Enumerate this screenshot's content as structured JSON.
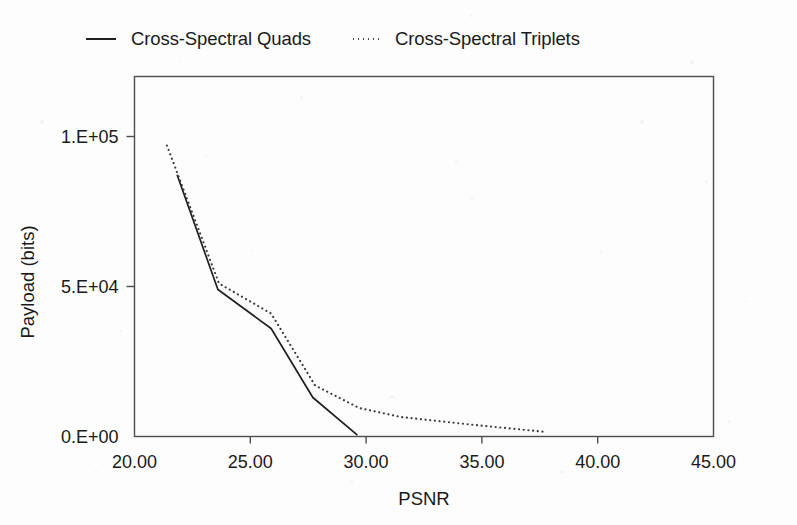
{
  "legend": {
    "entries": [
      {
        "label": "Cross-Spectral Quads",
        "style": "solid"
      },
      {
        "label": "Cross-Spectral Triplets",
        "style": "dotted"
      }
    ]
  },
  "axes": {
    "x_title": "PSNR",
    "y_title": "Payload (bits)",
    "x_ticks": [
      "20.00",
      "25.00",
      "30.00",
      "35.00",
      "40.00",
      "45.00"
    ],
    "y_ticks": [
      "0.E+00",
      "5.E+04",
      "1.E+05"
    ]
  },
  "chart_data": {
    "type": "line",
    "title": "",
    "xlabel": "PSNR",
    "ylabel": "Payload (bits)",
    "xlim": [
      20,
      45
    ],
    "ylim": [
      0,
      120000
    ],
    "xticks": [
      20,
      25,
      30,
      35,
      40,
      45
    ],
    "xticklabels": [
      "20.00",
      "25.00",
      "30.00",
      "35.00",
      "40.00",
      "45.00"
    ],
    "yticks": [
      0,
      50000,
      100000
    ],
    "yticklabels": [
      "0.E+00",
      "5.E+04",
      "1.E+05"
    ],
    "grid": false,
    "legend_position": "top",
    "series": [
      {
        "name": "Cross-Spectral Quads",
        "style": "solid",
        "color": "#1f1f1f",
        "x": [
          21.85,
          23.6,
          25.9,
          27.7,
          29.6
        ],
        "y": [
          87000,
          49000,
          36000,
          13000,
          600
        ]
      },
      {
        "name": "Cross-Spectral Triplets",
        "style": "dotted",
        "color": "#3a3a3a",
        "x": [
          21.4,
          23.65,
          25.9,
          27.8,
          29.7,
          31.5,
          34.5,
          37.8
        ],
        "y": [
          97000,
          51000,
          41000,
          17000,
          9500,
          6500,
          4000,
          1500
        ]
      }
    ]
  }
}
